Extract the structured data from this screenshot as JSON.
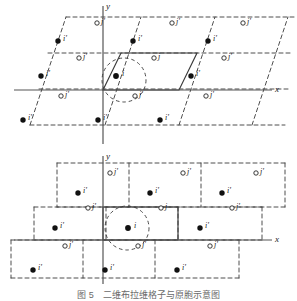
{
  "figure": {
    "axis_x_label": "x",
    "axis_y_label": "y",
    "caption": "图 5　二维布拉维格子与原胞示意图"
  },
  "colors": {
    "line": "#3a3a3a",
    "axis": "#555555",
    "dashed": "#3a3a3a",
    "filled_site": "#111111",
    "open_site": "#ffffff",
    "text": "#1a1a1a"
  },
  "site_labels": {
    "filled_primed": "i'",
    "filled_plain": "i",
    "open_primed": "j'",
    "open_plain": "j"
  },
  "panels": [
    {
      "name": "oblique-parallelogram-lattice",
      "cell_shape": "parallelogram",
      "unit_cell_solid": true,
      "origin": [
        103,
        90
      ],
      "axis_x_label": "x",
      "axis_y_label": "y",
      "filled_sites": [
        {
          "x": 58,
          "y": 41,
          "label": "i'"
        },
        {
          "x": 133,
          "y": 41,
          "label": "i'"
        },
        {
          "x": 208,
          "y": 41,
          "label": "i'"
        },
        {
          "x": 41,
          "y": 76,
          "label": "i'"
        },
        {
          "x": 116,
          "y": 76,
          "label": "i"
        },
        {
          "x": 191,
          "y": 76,
          "label": "i'"
        },
        {
          "x": 23,
          "y": 120,
          "label": "i'"
        },
        {
          "x": 98,
          "y": 120,
          "label": "i'"
        },
        {
          "x": 160,
          "y": 120,
          "label": "i'"
        }
      ],
      "open_sites": [
        {
          "x": 97,
          "y": 23,
          "label": "j'"
        },
        {
          "x": 172,
          "y": 23,
          "label": "j'"
        },
        {
          "x": 243,
          "y": 23,
          "label": "j'"
        },
        {
          "x": 79,
          "y": 58,
          "label": "j'"
        },
        {
          "x": 154,
          "y": 58,
          "label": "j"
        },
        {
          "x": 224,
          "y": 58,
          "label": "j'"
        },
        {
          "x": 61,
          "y": 96,
          "label": "j'"
        },
        {
          "x": 135,
          "y": 96,
          "label": "j'"
        },
        {
          "x": 206,
          "y": 96,
          "label": "j'"
        }
      ]
    },
    {
      "name": "staggered-rectangle-lattice",
      "cell_shape": "rectangle",
      "unit_cell_solid": true,
      "origin": [
        103,
        240
      ],
      "axis_x_label": "x",
      "axis_y_label": "y",
      "filled_sites": [
        {
          "x": 78,
          "y": 193,
          "label": "i'"
        },
        {
          "x": 150,
          "y": 193,
          "label": "i'"
        },
        {
          "x": 222,
          "y": 193,
          "label": "i'"
        },
        {
          "x": 55,
          "y": 228,
          "label": "i'"
        },
        {
          "x": 128,
          "y": 228,
          "label": "i"
        },
        {
          "x": 200,
          "y": 228,
          "label": "i'"
        },
        {
          "x": 33,
          "y": 270,
          "label": "i'"
        },
        {
          "x": 105,
          "y": 270,
          "label": "i'"
        },
        {
          "x": 177,
          "y": 270,
          "label": "i'"
        }
      ],
      "open_sites": [
        {
          "x": 110,
          "y": 173,
          "label": "j'"
        },
        {
          "x": 183,
          "y": 173,
          "label": "j'"
        },
        {
          "x": 256,
          "y": 173,
          "label": "j'"
        },
        {
          "x": 88,
          "y": 208,
          "label": "j'"
        },
        {
          "x": 161,
          "y": 208,
          "label": "j"
        },
        {
          "x": 232,
          "y": 208,
          "label": "j'"
        },
        {
          "x": 65,
          "y": 246,
          "label": "j'"
        },
        {
          "x": 138,
          "y": 246,
          "label": "j'"
        },
        {
          "x": 210,
          "y": 246,
          "label": "j'"
        }
      ]
    }
  ]
}
